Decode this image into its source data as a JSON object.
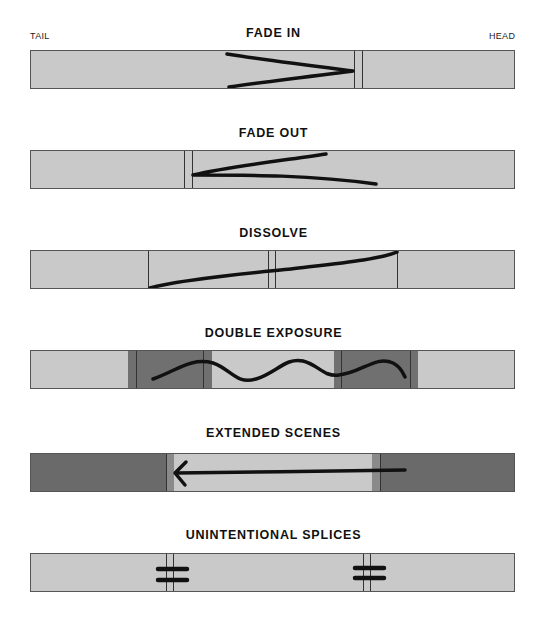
{
  "labels": {
    "tail": "TAIL",
    "head": "HEAD"
  },
  "colors": {
    "film_light": "#c9c9c9",
    "film_dark": "#6e6e6e",
    "film_mid": "#8a8a8a",
    "line": "#333333",
    "mark": "#111111"
  },
  "diagrams": [
    {
      "title": "FADE IN"
    },
    {
      "title": "FADE OUT"
    },
    {
      "title": "DISSOLVE"
    },
    {
      "title": "DOUBLE EXPOSURE"
    },
    {
      "title": "EXTENDED SCENES"
    },
    {
      "title": "UNINTENTIONAL SPLICES"
    }
  ]
}
